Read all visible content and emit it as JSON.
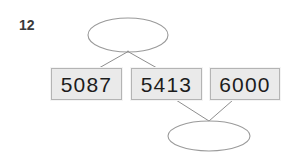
{
  "page": {
    "item_number": "12",
    "background_color": "#ffffff"
  },
  "diagram": {
    "type": "sorting-comparison-diagram",
    "cards": [
      {
        "value": "5087",
        "x": 51,
        "y": 68,
        "width": 71,
        "height": 32
      },
      {
        "value": "5413",
        "x": 131,
        "y": 68,
        "width": 71,
        "height": 32
      },
      {
        "value": "6000",
        "x": 210,
        "y": 68,
        "width": 70,
        "height": 32
      }
    ],
    "ellipses": [
      {
        "name": "top-ellipse",
        "position": "above-cards",
        "cx": 128,
        "cy": 35,
        "rx": 40,
        "ry": 17,
        "connects_to_cards": [
          "5087",
          "5413"
        ]
      },
      {
        "name": "bottom-ellipse",
        "position": "below-cards",
        "cx": 209,
        "cy": 136,
        "rx": 41,
        "ry": 15,
        "connects_to_cards": [
          "5413",
          "6000"
        ]
      }
    ],
    "connectors": [
      {
        "from": "top-ellipse",
        "to": "5087"
      },
      {
        "from": "top-ellipse",
        "to": "5413"
      },
      {
        "from": "5413",
        "to": "bottom-ellipse"
      },
      {
        "from": "6000",
        "to": "bottom-ellipse"
      }
    ],
    "colors": {
      "card_fill": "#eaeaea",
      "card_border": "#b4b4b4",
      "card_outer_edge": "#f4f4f4",
      "line": "#8e8e8e",
      "ellipse_stroke": "#9a9a9a",
      "number_text": "#1c1c1c",
      "item_number_text": "#3a3a3a"
    }
  }
}
